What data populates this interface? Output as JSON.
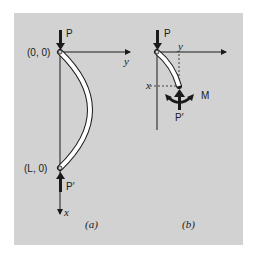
{
  "figure": {
    "panel_a": {
      "caption": "(a)",
      "top_point_label": "(0, 0)",
      "bottom_point_label": "(L, 0)",
      "top_force_label": "P",
      "bottom_force_label": "P′",
      "x_axis_label": "x",
      "y_axis_label": "y"
    },
    "panel_b": {
      "caption": "(b)",
      "top_force_label": "P",
      "bottom_force_label": "P′",
      "moment_label": "M",
      "x_label": "x",
      "y_label": "y"
    },
    "colors": {
      "background": "#d2d2d2",
      "ink": "#1a1a1a",
      "column_fill": "#ffffff"
    }
  }
}
